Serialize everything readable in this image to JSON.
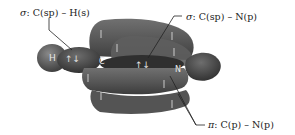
{
  "diagram": {
    "atoms": [
      {
        "symbol": "H",
        "x": 52,
        "y": 58
      },
      {
        "symbol": "C",
        "x": 102,
        "y": 61
      },
      {
        "symbol": "N",
        "x": 179,
        "y": 69
      }
    ],
    "labels": {
      "sigma_ch": {
        "prefix": "σ",
        "text": "C(sp) – H(s)"
      },
      "sigma_cn": {
        "prefix": "σ",
        "text": "C(sp) – N(p)"
      },
      "pi_cn": {
        "prefix": "π",
        "text": "C(p) – N(p)"
      }
    },
    "electron_arrows": {
      "sigma_ch": "↑↓",
      "sigma_cn": "↑↓"
    },
    "colors": {
      "orbital_dark": "#3e3e3e",
      "orbital_mid": "#5a5a5a",
      "orbital_light": "#7a7a7a",
      "leader_line": "#222222",
      "text": "#222222"
    }
  }
}
